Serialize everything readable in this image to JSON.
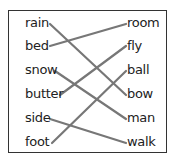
{
  "left_words": [
    "rain",
    "bed",
    "snow",
    "butter",
    "side",
    "foot"
  ],
  "right_words": [
    "room",
    "fly",
    "ball",
    "bow",
    "man",
    "walk"
  ],
  "matches": [
    {
      "left": "rain",
      "right": "bow"
    },
    {
      "left": "bed",
      "right": "room"
    },
    {
      "left": "snow",
      "right": "man"
    },
    {
      "left": "butter",
      "right": "fly"
    },
    {
      "left": "side",
      "right": "walk"
    },
    {
      "left": "foot",
      "right": "ball"
    }
  ],
  "line_color": "#777777"
}
